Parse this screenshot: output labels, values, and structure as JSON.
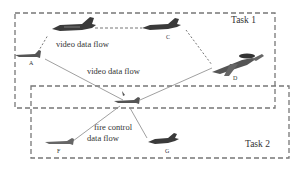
{
  "diagram": {
    "tasks": [
      {
        "id": "task1",
        "label": "Task 1"
      },
      {
        "id": "task2",
        "label": "Task 2"
      }
    ],
    "nodes": [
      {
        "id": "A",
        "label": "A",
        "type": "small-aircraft"
      },
      {
        "id": "B",
        "label": "",
        "type": "fighter-jet"
      },
      {
        "id": "C",
        "label": "C",
        "type": "fighter-jet"
      },
      {
        "id": "D",
        "label": "D",
        "type": "awacs-aircraft"
      },
      {
        "id": "E",
        "label": "E",
        "type": "small-aircraft"
      },
      {
        "id": "F",
        "label": "F",
        "type": "small-aircraft"
      },
      {
        "id": "G",
        "label": "G",
        "type": "fighter-jet"
      }
    ],
    "flows": [
      {
        "id": "flow1",
        "label": "video data flow"
      },
      {
        "id": "flow2",
        "label": "video data flow"
      },
      {
        "id": "flow3_line1",
        "label": "fire   control"
      },
      {
        "id": "flow3_line2",
        "label": "data flow"
      }
    ]
  }
}
